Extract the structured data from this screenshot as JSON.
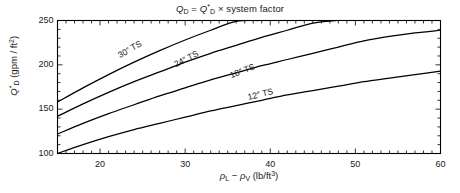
{
  "chart_data": {
    "type": "line",
    "title_parts": {
      "q1_base": "Q",
      "q1_sub": "D",
      "equals": " = ",
      "q2_base": "Q",
      "q2_sup": "*",
      "q2_sub": "D",
      "tail": " × system factor"
    },
    "xlabel": "ρ_L − ρ_V (lb/ft3)",
    "xlabel_parts": {
      "rho1": "ρ",
      "sub1": "L",
      "minus": " − ",
      "rho2": "ρ",
      "sub2": "V",
      "units_open": " (lb/ft",
      "units_sup": "3",
      "units_close": ")"
    },
    "ylabel": "Q*_D (gpm / ft2)",
    "ylabel_parts": {
      "q_base": "Q",
      "q_sup": "*",
      "q_sub": "D",
      "units_open": " (gpm / ft",
      "units_sup": "2",
      "units_close": ")"
    },
    "xlim": [
      15,
      60
    ],
    "ylim": [
      100,
      250
    ],
    "xticks": [
      20,
      30,
      40,
      50,
      60
    ],
    "xtick_labels": [
      "20",
      "30",
      "40",
      "50",
      "60"
    ],
    "yticks": [
      100,
      150,
      200,
      250
    ],
    "ytick_labels": [
      "100",
      "150",
      "200",
      "250"
    ],
    "x_minor_step": 1,
    "y_minor_step": 10,
    "grid": false,
    "legend": "inline-curve-labels",
    "line_color": "#000000",
    "axis_color": "#000000",
    "background": "#ffffff",
    "x": [
      15,
      18,
      21,
      24,
      27,
      30,
      33,
      36,
      39,
      42,
      45,
      48,
      51,
      54,
      57,
      60
    ],
    "series": [
      {
        "name": "30\" TS",
        "label": "30″ TS",
        "label_x": 22.5,
        "label_y": 205,
        "label_angle": -30,
        "values": [
          158,
          174,
          189,
          203,
          216,
          228,
          239,
          249,
          null,
          null,
          null,
          null,
          null,
          null,
          null,
          null
        ],
        "clipped_at_top": true,
        "exit_x": 38.6,
        "exit_y": 250
      },
      {
        "name": "24\" TS",
        "label": "24″ TS",
        "label_x": 29.0,
        "label_y": 195,
        "label_angle": -27,
        "values": [
          142,
          156,
          169,
          181,
          192,
          203,
          213,
          222,
          231,
          239,
          247,
          null,
          null,
          null,
          null,
          null
        ],
        "clipped_at_top": true,
        "exit_x": 47.8,
        "exit_y": 250
      },
      {
        "name": "18\" TS",
        "label": "18″ TS",
        "label_x": 35.5,
        "label_y": 183,
        "label_angle": -21,
        "values": [
          122,
          134,
          145,
          155,
          165,
          174,
          183,
          191,
          199,
          206,
          213,
          220,
          227,
          232,
          236,
          239
        ],
        "clipped_at_top": false
      },
      {
        "name": "12\" TS",
        "label": "12″ TS",
        "label_x": 37.5,
        "label_y": 158,
        "label_angle": -14,
        "values": [
          100,
          110,
          119,
          127,
          134,
          141,
          148,
          154,
          160,
          166,
          171,
          176,
          181,
          185,
          189,
          193
        ],
        "clipped_at_top": false
      }
    ]
  }
}
